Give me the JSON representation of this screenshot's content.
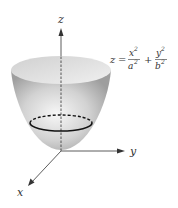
{
  "diagram": {
    "type": "elliptic-paraboloid",
    "axes": {
      "x_label": "x",
      "y_label": "y",
      "z_label": "z"
    },
    "equation": {
      "lhs": "z",
      "equals": "=",
      "term1_num": "x",
      "term1_num_exp": "2",
      "term1_den": "a",
      "term1_den_exp": "2",
      "plus": "+",
      "term2_num": "y",
      "term2_num_exp": "2",
      "term2_den": "b",
      "term2_den_exp": "2"
    },
    "colors": {
      "surface_light": "#f2f2f2",
      "surface_mid": "#c8c8c8",
      "surface_dark": "#9a9a9a",
      "axis": "#333333",
      "cross_section": "#111111"
    }
  }
}
